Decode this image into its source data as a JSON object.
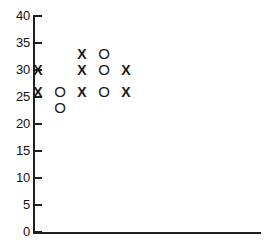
{
  "chart_data": {
    "type": "scatter",
    "title": "",
    "subtitle": "",
    "xlabel": "",
    "ylabel": "",
    "ylim": [
      0,
      40
    ],
    "xlim": [
      0,
      6
    ],
    "grid": false,
    "legend_position": "none",
    "y_ticks": [
      0,
      5,
      10,
      15,
      20,
      25,
      30,
      35,
      40
    ],
    "y_tick_labels": [
      "0",
      "5",
      "10",
      "15",
      "20",
      "25",
      "30",
      "35",
      "40"
    ],
    "x_ticks": [],
    "x_tick_labels": [],
    "marker_symbols": [
      "X",
      "O"
    ],
    "series": [
      {
        "name": "X",
        "symbol": "X",
        "x": [
          2,
          1,
          2,
          4,
          1,
          2,
          4
        ],
        "y": [
          33,
          30,
          30,
          30,
          26,
          26,
          26
        ]
      },
      {
        "name": "O",
        "symbol": "O",
        "x": [
          3,
          3,
          1,
          3,
          1
        ],
        "y": [
          33,
          30,
          26,
          26,
          23
        ]
      }
    ],
    "points": [
      {
        "symbol": "X",
        "col": 2,
        "value": 33
      },
      {
        "symbol": "O",
        "col": 3,
        "value": 33
      },
      {
        "symbol": "X",
        "col": 0,
        "value": 30
      },
      {
        "symbol": "X",
        "col": 2,
        "value": 30
      },
      {
        "symbol": "O",
        "col": 3,
        "value": 30
      },
      {
        "symbol": "X",
        "col": 4,
        "value": 30
      },
      {
        "symbol": "X",
        "col": 0,
        "value": 26
      },
      {
        "symbol": "O",
        "col": 1,
        "value": 26
      },
      {
        "symbol": "X",
        "col": 2,
        "value": 26
      },
      {
        "symbol": "O",
        "col": 3,
        "value": 26
      },
      {
        "symbol": "X",
        "col": 4,
        "value": 26
      },
      {
        "symbol": "O",
        "col": 1,
        "value": 23
      }
    ],
    "colors": {
      "axis": "#1f1f1f",
      "marker": "#181818",
      "background": "#ffffff"
    }
  },
  "layout": {
    "plot_left_px": 34,
    "plot_bottom_px": 232,
    "plot_top_px": 16,
    "col_start_px": 38,
    "col_spacing_px": 22,
    "px_per_unit": 5.4
  }
}
